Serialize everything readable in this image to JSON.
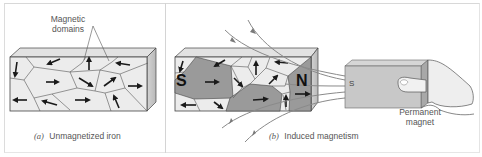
{
  "figure": {
    "panels": [
      {
        "id": "a",
        "caption_letter": "(a)",
        "caption_text": "Unmagnetized iron",
        "callout_line1": "Magnetic",
        "callout_line2": "domains"
      },
      {
        "id": "b",
        "caption_letter": "(b)",
        "caption_text": "Induced magnetism",
        "pole_south": "S",
        "pole_north": "N",
        "magnet_pole": "S",
        "magnet_label_line1": "Permanent",
        "magnet_label_line2": "magnet"
      }
    ],
    "colors": {
      "domain_light": "#ececec",
      "domain_dark": "#9a9a9a",
      "block_top": "#e2e2e2",
      "block_side": "#c4c4c4",
      "arrow": "#1a1a1a",
      "field_line": "#8a8a8a",
      "frame": "#d8d8d8"
    }
  }
}
